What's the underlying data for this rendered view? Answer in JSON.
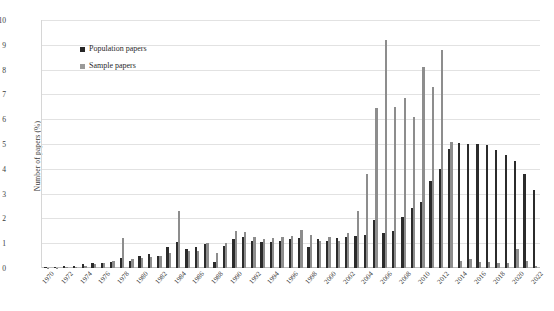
{
  "chart_data": {
    "type": "bar",
    "title": "",
    "xlabel": "",
    "ylabel": "Number of papers (%)",
    "ylim": [
      0,
      10
    ],
    "yticks": [
      0,
      1,
      2,
      3,
      4,
      5,
      6,
      7,
      8,
      9,
      10
    ],
    "grid": true,
    "legend_position": "upper-left-inside",
    "x_tick_step": 2,
    "x_tick_labels": [
      "1970",
      "1972",
      "1974",
      "1976",
      "1978",
      "1980",
      "1982",
      "1984",
      "1986",
      "1988",
      "1990",
      "1992",
      "1994",
      "1996",
      "1998",
      "2000",
      "2002",
      "2004",
      "2006",
      "2008",
      "2010",
      "2012",
      "2014",
      "2016",
      "2018",
      "2020",
      "2022"
    ],
    "categories": [
      "1970",
      "1971",
      "1972",
      "1973",
      "1974",
      "1975",
      "1976",
      "1977",
      "1978",
      "1979",
      "1980",
      "1981",
      "1982",
      "1983",
      "1984",
      "1985",
      "1986",
      "1987",
      "1988",
      "1989",
      "1990",
      "1991",
      "1992",
      "1993",
      "1994",
      "1995",
      "1996",
      "1997",
      "1998",
      "1999",
      "2000",
      "2001",
      "2002",
      "2003",
      "2004",
      "2005",
      "2006",
      "2007",
      "2008",
      "2009",
      "2010",
      "2011",
      "2012",
      "2013",
      "2014",
      "2015",
      "2016",
      "2017",
      "2018",
      "2019",
      "2020",
      "2021",
      "2022"
    ],
    "series": [
      {
        "name": "Population papers",
        "color": "#2b2b2b",
        "values": [
          0.05,
          0.05,
          0.08,
          0.08,
          0.15,
          0.2,
          0.2,
          0.25,
          0.4,
          0.3,
          0.5,
          0.55,
          0.5,
          0.85,
          1.05,
          0.75,
          0.85,
          0.95,
          0.25,
          0.9,
          1.15,
          1.25,
          1.1,
          1.05,
          1.05,
          1.1,
          1.15,
          1.2,
          0.85,
          1.15,
          1.1,
          1.2,
          1.25,
          1.3,
          1.35,
          1.95,
          1.4,
          1.5,
          2.05,
          2.4,
          2.65,
          3.5,
          4.0,
          4.8,
          5.05,
          5.0,
          5.0,
          4.95,
          4.75,
          4.55,
          4.3,
          3.8,
          3.15
        ]
      },
      {
        "name": "Sample papers",
        "color": "#8d8d8d",
        "values": [
          0.0,
          0.0,
          0.05,
          0.05,
          0.1,
          0.15,
          0.2,
          0.3,
          1.2,
          0.35,
          0.4,
          0.45,
          0.5,
          0.6,
          2.3,
          0.7,
          0.7,
          1.0,
          0.6,
          1.0,
          1.5,
          1.45,
          1.25,
          1.15,
          1.2,
          1.25,
          1.3,
          1.55,
          1.35,
          1.1,
          1.25,
          1.1,
          1.4,
          2.3,
          3.8,
          6.45,
          9.2,
          6.5,
          6.85,
          6.1,
          8.1,
          7.3,
          8.8,
          5.1,
          0.3,
          0.35,
          0.25,
          0.25,
          0.2,
          0.2,
          0.75,
          0.3,
          0.1
        ]
      }
    ]
  },
  "legend": {
    "items": [
      {
        "label": "Population papers",
        "swatch": "dark-square"
      },
      {
        "label": "Sample papers",
        "swatch": "gray-square"
      }
    ]
  },
  "axes": {
    "y_title": "Number of papers (%)"
  }
}
